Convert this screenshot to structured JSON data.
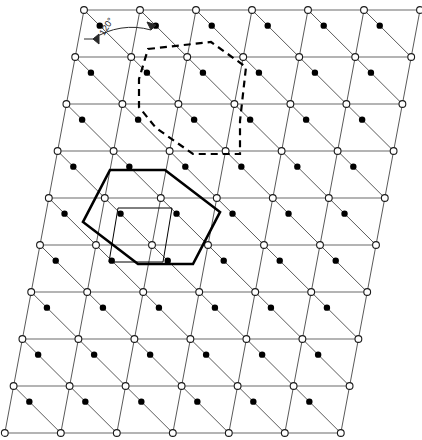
{
  "figure": {
    "background_color": "#ffffff",
    "width": 422,
    "height": 440
  },
  "annotations": {
    "angle_label": "120°",
    "angle_label_x": 104,
    "angle_label_y": 36,
    "angle_label_rotation": -58
  },
  "colors": {
    "lattice_line": "#5a5a5a",
    "lattice_node_stroke": "#1a1a1a",
    "lattice_node_fill": "#ffffff",
    "basis_dot": "#000000",
    "bold_cell": "#000000",
    "dashed_cell": "#000000",
    "thin_cell": "#000000"
  },
  "lattice": {
    "type": "oblique-triangular",
    "rows": 10,
    "cols": 7,
    "origin_x": 84,
    "origin_y": 10,
    "col_spacing": 56,
    "row_spacing": 47,
    "row_shear": -8.8,
    "node_radius": 3.4,
    "basis_dot_radius": 3.2,
    "interior_angle_deg": 120
  },
  "shapes": {
    "bold_hexagon": {
      "name": "primitive-cell-bold",
      "points": "110,170 165,170 220,212 193,264 138,264 83,222"
    },
    "dashed_hexagon": {
      "name": "primitive-cell-dashed",
      "points": "148,49 211,42 246,67 240,121 240,154 193,154 156,128 139,107 139,79"
    },
    "thin_rhombus": {
      "name": "basis-rhombus-thin",
      "points": "118,208 172,208 163,262 109,262"
    }
  },
  "legend": {
    "node_meaning": "lattice-point",
    "dot_meaning": "basis-atom"
  }
}
